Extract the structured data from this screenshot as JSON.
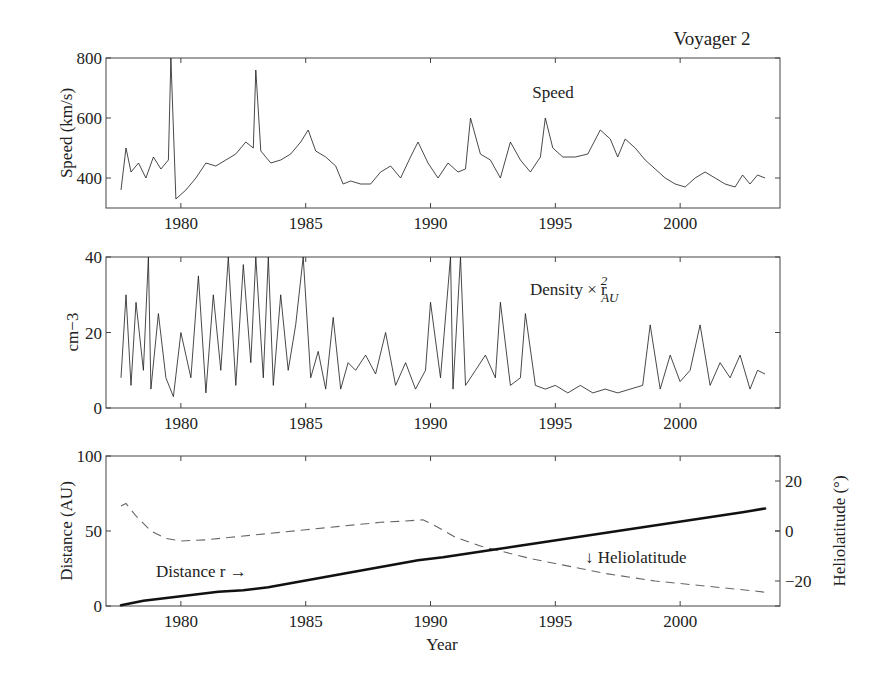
{
  "figure": {
    "title": "Voyager 2",
    "xlabel": "Year"
  },
  "panels": {
    "speed": {
      "ylabel": "Speed (km/s)",
      "annotation": "Speed",
      "yticks": [
        "800",
        "600",
        "400"
      ],
      "xticks": [
        "1980",
        "1985",
        "1990",
        "1995",
        "2000"
      ]
    },
    "density": {
      "ylabel": "cm−3",
      "annotation_main": "Density × r",
      "annotation_sup": "2",
      "annotation_sub": "AU",
      "yticks": [
        "40",
        "20",
        "0"
      ],
      "xticks": [
        "1980",
        "1985",
        "1990",
        "1995",
        "2000"
      ]
    },
    "distance": {
      "ylabel_left": "Distance (AU)",
      "ylabel_right": "Heliolatitude (°)",
      "annotation_distance": "Distance r →",
      "annotation_lat": "↓ Heliolatitude",
      "yticks_left": [
        "100",
        "50",
        "0"
      ],
      "yticks_right": [
        "20",
        "0",
        "−20"
      ],
      "xticks": [
        "1980",
        "1985",
        "1990",
        "1995",
        "2000"
      ]
    }
  },
  "chart_data": [
    {
      "type": "line",
      "title": "Voyager 2 — Speed",
      "xlabel": "",
      "ylabel": "Speed (km/s)",
      "xlim": [
        1977,
        2004
      ],
      "ylim": [
        300,
        800
      ],
      "grid": false,
      "series": [
        {
          "name": "Speed",
          "x": [
            1977.6,
            1977.8,
            1978.0,
            1978.3,
            1978.6,
            1978.9,
            1979.2,
            1979.5,
            1979.6,
            1979.8,
            1980.2,
            1980.6,
            1981.0,
            1981.4,
            1981.8,
            1982.2,
            1982.6,
            1982.9,
            1983.0,
            1983.2,
            1983.6,
            1984.0,
            1984.4,
            1984.8,
            1985.1,
            1985.4,
            1985.8,
            1986.2,
            1986.5,
            1986.8,
            1987.2,
            1987.6,
            1988.0,
            1988.4,
            1988.8,
            1989.2,
            1989.5,
            1989.9,
            1990.3,
            1990.7,
            1991.1,
            1991.4,
            1991.6,
            1992.0,
            1992.4,
            1992.8,
            1993.2,
            1993.6,
            1994.0,
            1994.4,
            1994.6,
            1994.9,
            1995.3,
            1995.8,
            1996.3,
            1996.8,
            1997.2,
            1997.5,
            1997.8,
            1998.2,
            1998.6,
            1999.0,
            1999.4,
            1999.8,
            2000.2,
            2000.6,
            2001.0,
            2001.4,
            2001.8,
            2002.2,
            2002.5,
            2002.8,
            2003.1,
            2003.4
          ],
          "values": [
            360,
            500,
            420,
            450,
            400,
            470,
            430,
            460,
            800,
            330,
            360,
            400,
            450,
            440,
            460,
            480,
            520,
            500,
            760,
            490,
            450,
            460,
            480,
            520,
            560,
            490,
            470,
            440,
            380,
            390,
            380,
            380,
            420,
            440,
            400,
            470,
            520,
            450,
            400,
            450,
            420,
            430,
            600,
            480,
            460,
            400,
            520,
            460,
            420,
            470,
            600,
            500,
            470,
            470,
            480,
            560,
            530,
            470,
            530,
            500,
            460,
            430,
            400,
            380,
            370,
            400,
            420,
            400,
            380,
            370,
            410,
            380,
            410,
            400
          ]
        }
      ]
    },
    {
      "type": "line",
      "title": "Voyager 2 — Density × r_AU^2",
      "xlabel": "",
      "ylabel": "cm-3",
      "xlim": [
        1977,
        2004
      ],
      "ylim": [
        0,
        40
      ],
      "grid": false,
      "series": [
        {
          "name": "Density × r_AU^2",
          "x": [
            1977.6,
            1977.8,
            1978.0,
            1978.2,
            1978.5,
            1978.7,
            1978.8,
            1979.1,
            1979.4,
            1979.7,
            1980.0,
            1980.4,
            1980.7,
            1981.0,
            1981.3,
            1981.6,
            1981.9,
            1982.2,
            1982.5,
            1982.8,
            1983.0,
            1983.3,
            1983.5,
            1983.7,
            1984.0,
            1984.3,
            1984.6,
            1984.9,
            1985.2,
            1985.5,
            1985.8,
            1986.1,
            1986.4,
            1986.7,
            1987.0,
            1987.4,
            1987.8,
            1988.2,
            1988.6,
            1989.0,
            1989.4,
            1989.8,
            1990.0,
            1990.4,
            1990.8,
            1990.9,
            1991.2,
            1991.4,
            1991.8,
            1992.2,
            1992.6,
            1992.8,
            1993.2,
            1993.6,
            1993.8,
            1994.2,
            1994.6,
            1995.0,
            1995.5,
            1996.0,
            1996.5,
            1997.0,
            1997.5,
            1998.0,
            1998.5,
            1998.8,
            1999.2,
            1999.6,
            2000.0,
            2000.4,
            2000.8,
            2001.2,
            2001.6,
            2002.0,
            2002.4,
            2002.8,
            2003.1,
            2003.4
          ],
          "values": [
            8,
            30,
            6,
            28,
            10,
            40,
            5,
            25,
            8,
            3,
            20,
            8,
            35,
            4,
            30,
            10,
            40,
            6,
            38,
            12,
            40,
            8,
            40,
            6,
            30,
            10,
            22,
            40,
            8,
            15,
            5,
            24,
            5,
            12,
            10,
            14,
            9,
            20,
            6,
            12,
            5,
            10,
            28,
            8,
            40,
            5,
            40,
            6,
            10,
            14,
            8,
            28,
            6,
            8,
            25,
            6,
            5,
            6,
            4,
            6,
            4,
            5,
            4,
            5,
            6,
            22,
            5,
            14,
            7,
            10,
            22,
            6,
            12,
            8,
            14,
            5,
            10,
            9
          ]
        }
      ]
    },
    {
      "type": "line",
      "title": "Voyager 2 — Distance and Heliolatitude",
      "xlabel": "Year",
      "ylabel": "Distance (AU)",
      "ylabel_right": "Heliolatitude (°)",
      "xlim": [
        1977,
        2004
      ],
      "ylim": [
        0,
        100
      ],
      "ylim_right": [
        -30,
        30
      ],
      "xticks": [
        1980,
        1985,
        1990,
        1995,
        2000
      ],
      "grid": false,
      "series": [
        {
          "name": "Distance r",
          "axis": "left",
          "style": "solid-thick",
          "x": [
            1977.6,
            1978.5,
            1979.5,
            1980.5,
            1981.5,
            1982.5,
            1983.5,
            1984.5,
            1985.5,
            1986.5,
            1987.5,
            1988.5,
            1989.5,
            1990.5,
            1991.5,
            1992.5,
            1993.5,
            1994.5,
            1995.5,
            1996.5,
            1997.5,
            1998.5,
            1999.5,
            2000.5,
            2001.5,
            2002.5,
            2003.4
          ],
          "values": [
            0.5,
            3.5,
            5.5,
            7.5,
            9.5,
            10.5,
            12.5,
            15.5,
            18.5,
            21.5,
            24.5,
            27.5,
            30.5,
            32.5,
            35,
            37.5,
            40,
            42.5,
            45,
            47.5,
            50,
            52.5,
            55,
            57.5,
            60,
            62.5,
            65
          ]
        },
        {
          "name": "Heliolatitude",
          "axis": "right",
          "style": "dashed",
          "x": [
            1977.6,
            1977.8,
            1978.2,
            1978.8,
            1979.4,
            1980.0,
            1981.0,
            1982.0,
            1983.0,
            1984.0,
            1985.0,
            1986.0,
            1987.0,
            1988.0,
            1989.0,
            1989.7,
            1990.2,
            1991.0,
            1992.0,
            1993.0,
            1994.0,
            1995.0,
            1996.0,
            1997.0,
            1998.0,
            1999.0,
            2000.0,
            2001.0,
            2002.0,
            2003.0,
            2003.4
          ],
          "values": [
            10,
            11,
            6,
            0,
            -3,
            -4,
            -3.5,
            -2.5,
            -1.5,
            -0.5,
            0.5,
            1.5,
            2.5,
            3.5,
            4,
            4.5,
            2,
            -2.5,
            -6,
            -8.5,
            -11,
            -13,
            -15,
            -17,
            -18.5,
            -20,
            -21,
            -22,
            -23,
            -24,
            -24.5
          ]
        }
      ]
    }
  ]
}
